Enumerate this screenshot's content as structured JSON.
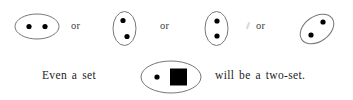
{
  "figure": {
    "caption_line": "Even a set  [ dot , square ]  will be a two-set.",
    "background_color": "#ffffff",
    "outline_color": "#777777",
    "element_color": "#000000"
  },
  "row_top": {
    "connectors": [
      {
        "label": "or"
      },
      {
        "label": "or"
      },
      {
        "label": "or"
      }
    ],
    "sets": [
      {
        "name": "two-set-horizontal",
        "orientation": "horizontal",
        "rotation_deg": 0,
        "element_count": 2,
        "element_kinds": [
          "dot",
          "dot"
        ],
        "arrangement": "side-by-side"
      },
      {
        "name": "two-set-vertical-diagonal",
        "orientation": "vertical",
        "rotation_deg": 0,
        "element_count": 2,
        "element_kinds": [
          "dot",
          "dot"
        ],
        "arrangement": "diagonal-top-left-to-bottom-right"
      },
      {
        "name": "two-set-vertical-stacked",
        "orientation": "vertical",
        "rotation_deg": 0,
        "element_count": 2,
        "element_kinds": [
          "dot",
          "dot"
        ],
        "arrangement": "stacked"
      },
      {
        "name": "two-set-tilted",
        "orientation": "tilted",
        "rotation_deg": -35,
        "element_count": 2,
        "element_kinds": [
          "dot",
          "dot"
        ],
        "arrangement": "diagonal-top-right-to-bottom-left"
      }
    ]
  },
  "row_bottom": {
    "text_before": "Even a set",
    "text_after": "will be a two-set.",
    "set": {
      "name": "two-set-dot-and-square",
      "orientation": "horizontal",
      "rotation_deg": 0,
      "element_count": 2,
      "element_kinds": [
        "dot",
        "square"
      ],
      "arrangement": "side-by-side"
    }
  }
}
